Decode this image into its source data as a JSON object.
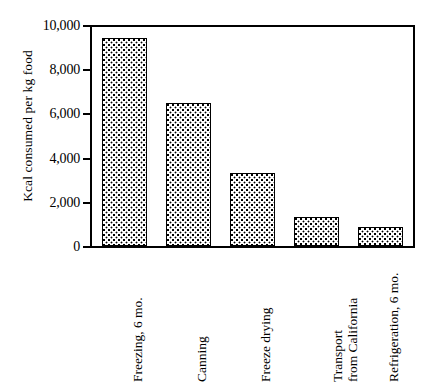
{
  "chart_data": {
    "type": "bar",
    "title": "",
    "subtitle": "",
    "xlabel": "",
    "ylabel": "Kcal consumed per kg food",
    "ylim": [
      0,
      10000
    ],
    "ytick_values": [
      0,
      2000,
      4000,
      6000,
      8000,
      10000
    ],
    "ytick_labels": [
      "0",
      "2,000",
      "4,000",
      "6,000",
      "8,000",
      "10,000"
    ],
    "grid": false,
    "legend": null,
    "legend_position": "none",
    "categories": [
      "Freezing, 6 mo.",
      "Canning",
      "Freeze drying",
      "Transport from California",
      "Refrigeration, 6 mo."
    ],
    "category_lines": [
      [
        "Freezing, 6 mo."
      ],
      [
        "Canning"
      ],
      [
        "Freeze drying"
      ],
      [
        "Transport",
        "from California"
      ],
      [
        "Refrigeration, 6 mo."
      ]
    ],
    "values": [
      9500,
      6550,
      3350,
      1330,
      850
    ],
    "bar_fill": "stippled-dots",
    "bar_edge_color": "#000000",
    "bar_face_color": "#ffffff",
    "axis_color": "#000000",
    "background_color": "#ffffff"
  }
}
